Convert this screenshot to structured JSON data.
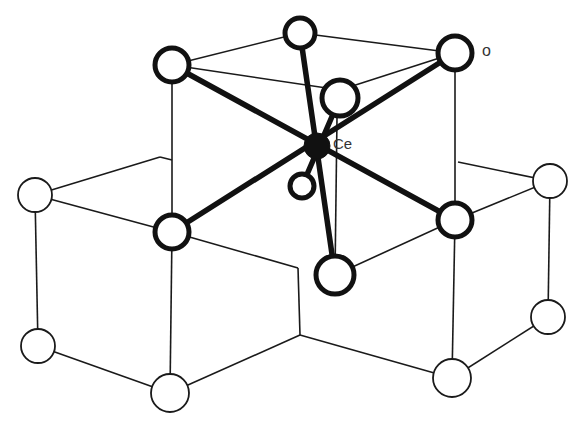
{
  "figure": {
    "type": "crystal structure diagram",
    "labels": {
      "center_atom": "Ce",
      "corner_atom": "o"
    },
    "colors": {
      "background": "#ffffff",
      "lines": "#1a1a1a",
      "ce_atom": "#111111"
    }
  }
}
